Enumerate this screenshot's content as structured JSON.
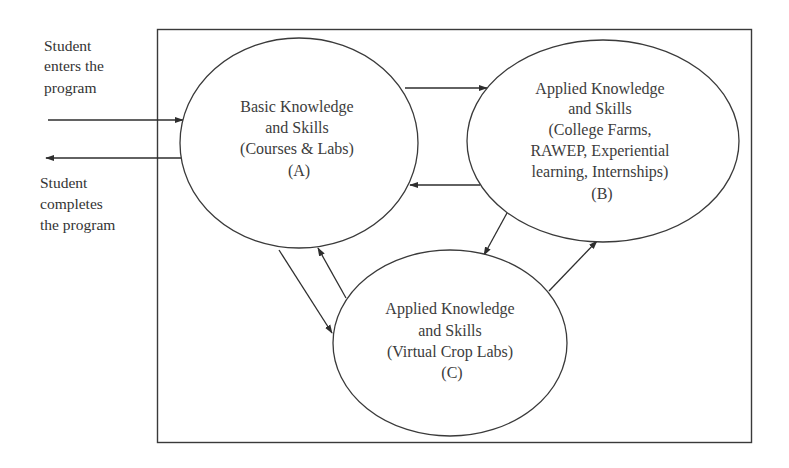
{
  "diagram": {
    "colors": {
      "line": "#2e2e2e",
      "text": "#3c3c3c",
      "background": "#ffffff"
    },
    "entry_label": {
      "lines": [
        "Student",
        "enters the",
        "program"
      ]
    },
    "exit_label": {
      "lines": [
        "Student",
        "completes",
        "the program"
      ]
    },
    "nodes": [
      {
        "id": "A",
        "lines": [
          "Basic Knowledge",
          "and Skills",
          "(Courses & Labs)",
          "(A)"
        ]
      },
      {
        "id": "B",
        "lines": [
          "Applied Knowledge",
          "and Skills",
          "(College Farms,",
          "RAWEP, Experiential",
          "learning, Internships)",
          "(B)"
        ]
      },
      {
        "id": "C",
        "lines": [
          "Applied Knowledge",
          "and Skills",
          "(Virtual Crop Labs)",
          "(C)"
        ]
      }
    ],
    "edges": [
      {
        "from": "outside",
        "to": "A",
        "label": "enters"
      },
      {
        "from": "A",
        "to": "outside",
        "label": "completes"
      },
      {
        "from": "A",
        "to": "B"
      },
      {
        "from": "B",
        "to": "A"
      },
      {
        "from": "A",
        "to": "C"
      },
      {
        "from": "C",
        "to": "A"
      },
      {
        "from": "B",
        "to": "C"
      },
      {
        "from": "C",
        "to": "B"
      }
    ]
  }
}
